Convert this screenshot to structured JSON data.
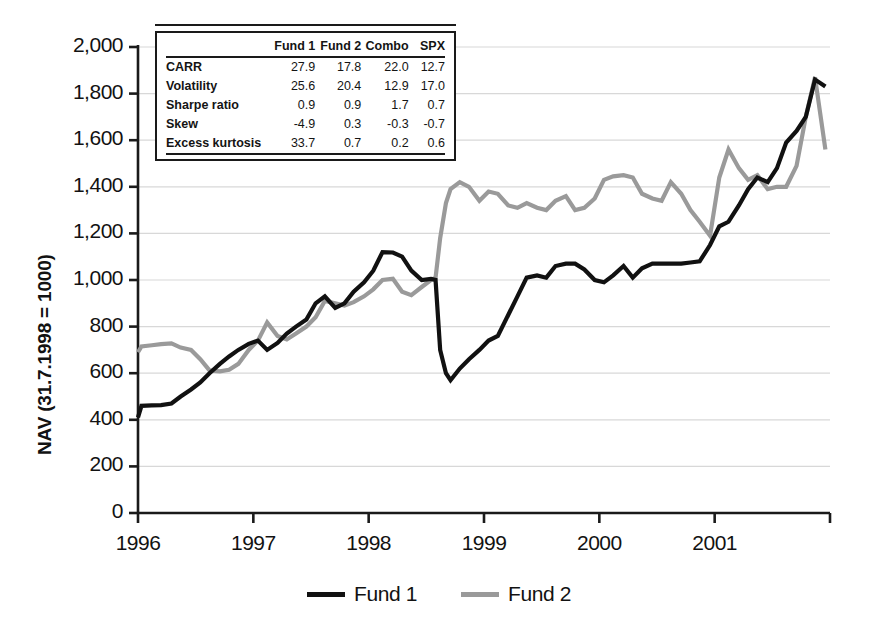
{
  "chart_data": {
    "type": "line",
    "title": "",
    "xlabel": "",
    "ylabel": "NAV (31.7.1998 = 1000)",
    "xlim": [
      1996.0,
      2002.0
    ],
    "ylim": [
      0,
      2000
    ],
    "ytick_values": [
      0,
      200,
      400,
      600,
      800,
      1000,
      1200,
      1400,
      1600,
      1800,
      2000
    ],
    "ytick_labels": [
      "0",
      "200",
      "400",
      "600",
      "800",
      "1,000",
      "1,200",
      "1,400",
      "1,600",
      "1,800",
      "2,000"
    ],
    "xtick_values": [
      1996,
      1997,
      1998,
      1999,
      2000,
      2001
    ],
    "xtick_labels": [
      "1996",
      "1997",
      "1998",
      "1999",
      "2000",
      "2001"
    ],
    "grid": "horizontal",
    "legend_position": "bottom-center",
    "series": [
      {
        "name": "Fund 1",
        "color": "#111111",
        "width": 4.2,
        "x": [
          1996.0,
          1996.03,
          1996.12,
          1996.2,
          1996.29,
          1996.37,
          1996.46,
          1996.54,
          1996.62,
          1996.71,
          1996.79,
          1996.87,
          1996.96,
          1997.04,
          1997.12,
          1997.21,
          1997.29,
          1997.37,
          1997.46,
          1997.54,
          1997.62,
          1997.71,
          1997.79,
          1997.87,
          1997.96,
          1998.04,
          1998.12,
          1998.21,
          1998.29,
          1998.37,
          1998.46,
          1998.54,
          1998.58,
          1998.62,
          1998.67,
          1998.71,
          1998.79,
          1998.87,
          1998.96,
          1999.04,
          1999.12,
          1999.21,
          1999.29,
          1999.37,
          1999.46,
          1999.54,
          1999.62,
          1999.71,
          1999.79,
          1999.87,
          1999.96,
          2000.04,
          2000.12,
          2000.21,
          2000.29,
          2000.37,
          2000.46,
          2000.54,
          2000.62,
          2000.71,
          2000.79,
          2000.87,
          2000.96,
          2001.04,
          2001.12,
          2001.21,
          2001.29,
          2001.37,
          2001.46,
          2001.54,
          2001.62,
          2001.71,
          2001.79,
          2001.87,
          2001.96
        ],
        "y": [
          410,
          460,
          462,
          463,
          470,
          500,
          530,
          560,
          600,
          640,
          672,
          700,
          726,
          740,
          700,
          730,
          770,
          800,
          830,
          900,
          930,
          880,
          900,
          950,
          990,
          1040,
          1120,
          1118,
          1100,
          1040,
          1000,
          1005,
          1000,
          700,
          600,
          570,
          620,
          660,
          700,
          740,
          760,
          850,
          930,
          1010,
          1020,
          1010,
          1060,
          1070,
          1070,
          1045,
          1000,
          990,
          1020,
          1060,
          1010,
          1050,
          1070,
          1070,
          1070,
          1070,
          1075,
          1080,
          1150,
          1230,
          1250,
          1320,
          1390,
          1440,
          1420,
          1480,
          1590,
          1640,
          1700,
          1860,
          1830
        ]
      },
      {
        "name": "Fund 2",
        "color": "#9a9a9a",
        "width": 4.2,
        "x": [
          1996.0,
          1996.03,
          1996.12,
          1996.2,
          1996.29,
          1996.37,
          1996.46,
          1996.54,
          1996.62,
          1996.71,
          1996.79,
          1996.87,
          1996.96,
          1997.04,
          1997.12,
          1997.21,
          1997.29,
          1997.37,
          1997.46,
          1997.54,
          1997.62,
          1997.71,
          1997.79,
          1997.87,
          1997.96,
          1998.04,
          1998.12,
          1998.21,
          1998.29,
          1998.37,
          1998.46,
          1998.54,
          1998.58,
          1998.62,
          1998.67,
          1998.71,
          1998.79,
          1998.87,
          1998.96,
          1999.04,
          1999.12,
          1999.21,
          1999.29,
          1999.37,
          1999.46,
          1999.54,
          1999.62,
          1999.71,
          1999.79,
          1999.87,
          1999.96,
          2000.04,
          2000.12,
          2000.21,
          2000.29,
          2000.37,
          2000.46,
          2000.54,
          2000.62,
          2000.71,
          2000.79,
          2000.87,
          2000.96,
          2001.04,
          2001.12,
          2001.21,
          2001.29,
          2001.37,
          2001.46,
          2001.54,
          2001.62,
          2001.71,
          2001.79,
          2001.87,
          2001.96
        ],
        "y": [
          690,
          715,
          720,
          725,
          728,
          710,
          700,
          660,
          612,
          608,
          615,
          640,
          700,
          740,
          818,
          760,
          745,
          770,
          800,
          840,
          910,
          900,
          890,
          905,
          930,
          960,
          1000,
          1005,
          950,
          935,
          970,
          1000,
          1010,
          1180,
          1330,
          1390,
          1420,
          1400,
          1340,
          1380,
          1370,
          1320,
          1310,
          1330,
          1310,
          1300,
          1340,
          1360,
          1300,
          1310,
          1350,
          1430,
          1445,
          1450,
          1440,
          1370,
          1350,
          1340,
          1420,
          1370,
          1300,
          1250,
          1190,
          1440,
          1560,
          1480,
          1430,
          1450,
          1390,
          1400,
          1400,
          1490,
          1700,
          1870,
          1560
        ]
      }
    ]
  },
  "stats_table": {
    "columns": [
      "",
      "Fund 1",
      "Fund 2",
      "Combo",
      "SPX"
    ],
    "rows": [
      {
        "label": "CARR",
        "values": [
          "27.9",
          "17.8",
          "22.0",
          "12.7"
        ]
      },
      {
        "label": "Volatility",
        "values": [
          "25.6",
          "20.4",
          "12.9",
          "17.0"
        ]
      },
      {
        "label": "Sharpe ratio",
        "values": [
          "0.9",
          "0.9",
          "1.7",
          "0.7"
        ]
      },
      {
        "label": "Skew",
        "values": [
          "-4.9",
          "0.3",
          "-0.3",
          "-0.7"
        ]
      },
      {
        "label": "Excess kurtosis",
        "values": [
          "33.7",
          "0.7",
          "0.2",
          "0.6"
        ]
      }
    ]
  },
  "style": {
    "fund1_color": "#111111",
    "fund2_color": "#9a9a9a",
    "axis_color": "#1a1a1a",
    "grid_color": "#d8d8d8",
    "background": "#ffffff"
  }
}
